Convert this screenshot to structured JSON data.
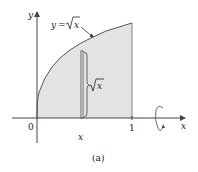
{
  "figure": {
    "caption": "(a)",
    "curve_label": "y = √x",
    "curve_label_parts": {
      "lhs": "y",
      "eq": "=",
      "radicand": "x"
    },
    "strip_height_label_radicand": "x",
    "axes": {
      "x_label": "x",
      "y_label": "y",
      "origin_label": "0",
      "tick_labels": {
        "x_sample": "x",
        "one": "1"
      }
    },
    "colors": {
      "region_fill": "#e3e3e3",
      "line": "#444444",
      "text": "#222222"
    },
    "rotation_axis": "x-axis"
  }
}
